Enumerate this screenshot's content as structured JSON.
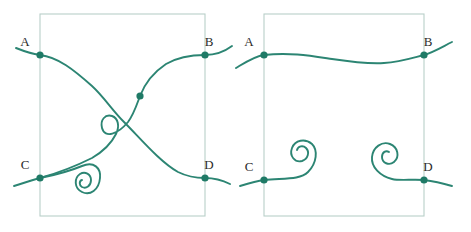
{
  "figure": {
    "background_color": "#ffffff",
    "strand_color": "#2c8573",
    "node_color": "#1f7a66",
    "frame_color": "#b9cfc9",
    "label_color": "#2b2b2b",
    "width": 471,
    "height": 232
  },
  "panels": [
    {
      "name": "left-panel",
      "description": "Tangle with crossing strands and a spiral",
      "frame": {
        "x": 40,
        "y": 14,
        "width": 165,
        "height": 202
      },
      "points": [
        {
          "id": "A",
          "label": "A",
          "x": 40,
          "y": 55,
          "label_x": 25,
          "label_y": 46
        },
        {
          "id": "B",
          "label": "B",
          "x": 205,
          "y": 55,
          "label_x": 209,
          "label_y": 46
        },
        {
          "id": "C",
          "label": "C",
          "x": 40,
          "y": 178,
          "label_x": 25,
          "label_y": 169
        },
        {
          "id": "D",
          "label": "D",
          "x": 205,
          "y": 178,
          "label_x": 209,
          "label_y": 169
        },
        {
          "id": "X",
          "label": "",
          "x": 140,
          "y": 96,
          "label_x": 0,
          "label_y": 0
        }
      ],
      "strands": [
        {
          "name": "strand-A-to-D",
          "from": "A",
          "to": "D",
          "path": "M 16 48 C 26 52 33 54 40 55 C 58 57 74 70 92 86 C 104 97 112 110 124 122 C 140 138 160 162 178 172 C 188 177 197 178 205 178 C 214 178 222 180 230 184"
        },
        {
          "name": "strand-C-to-B-with-loop",
          "from": "C",
          "to": "B",
          "path": "M 14 186 C 24 183 32 180 40 178 C 58 173 76 166 92 158 C 104 151 112 142 116 134 C 120 126 118 118 112 116 C 105 114 100 120 102 128 C 105 139 118 134 128 122 C 134 114 137 104 140 96 C 145 83 154 72 166 64 C 178 57 192 55 205 55 C 215 55 224 52 232 46"
        },
        {
          "name": "spiral-bottom-left",
          "from": "C",
          "to": "spiral-center",
          "path": "M 40 178 C 55 175 70 171 82 166 C 94 161 101 168 100 178 C 99 190 90 196 82 192 C 74 188 74 178 80 174 C 85 171 91 174 91 180 C 91 186 86 189 82 187 C 79 185 79 181 82 180"
        }
      ]
    },
    {
      "name": "right-panel",
      "description": "Tangle with a wavy horizontal strand and two spirals",
      "frame": {
        "x": 264,
        "y": 14,
        "width": 160,
        "height": 202
      },
      "points": [
        {
          "id": "A",
          "label": "A",
          "x": 264,
          "y": 55,
          "label_x": 249,
          "label_y": 46
        },
        {
          "id": "B",
          "label": "B",
          "x": 424,
          "y": 55,
          "label_x": 428,
          "label_y": 46
        },
        {
          "id": "C",
          "label": "C",
          "x": 264,
          "y": 180,
          "label_x": 249,
          "label_y": 171
        },
        {
          "id": "D",
          "label": "D",
          "x": 424,
          "y": 180,
          "label_x": 428,
          "label_y": 171
        }
      ],
      "strands": [
        {
          "name": "strand-A-to-B-wavy",
          "from": "A",
          "to": "B",
          "path": "M 236 68 C 246 62 255 56 264 55 C 290 52 312 56 332 59 C 352 62 368 64 384 63 C 400 62 412 58 424 55 C 434 52 442 47 452 42"
        },
        {
          "name": "spiral-C-left",
          "from": "C",
          "to": "spiral-center",
          "path": "M 240 186 C 250 183 257 181 264 180 C 284 178 300 180 308 172 C 317 163 318 150 312 144 C 305 138 295 140 292 148 C 289 156 295 163 302 161 C 308 159 310 152 306 148 C 303 145 298 146 297 150"
        },
        {
          "name": "spiral-D-right",
          "from": "D",
          "to": "spiral-center",
          "path": "M 452 186 C 442 183 433 181 424 180 C 412 179 400 181 392 179 C 380 176 371 167 372 157 C 373 147 382 141 390 144 C 398 147 400 157 394 162 C 389 166 382 163 382 157 C 382 152 386 150 389 152"
        }
      ]
    }
  ]
}
